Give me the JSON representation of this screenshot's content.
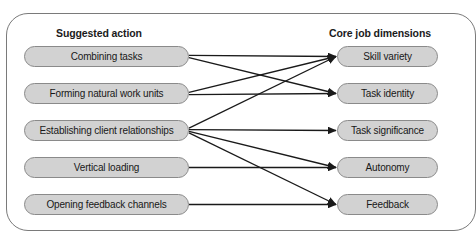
{
  "figure": {
    "frame": {
      "border_color": "#7a7a7a"
    },
    "colors": {
      "node_fill": "#d2d2d2",
      "node_border": "#8a8a8a",
      "connector": "#1a1a1a",
      "text": "#181818"
    }
  },
  "headers": {
    "left": "Suggested action",
    "right": "Core job dimensions"
  },
  "suggested_actions": [
    {
      "id": "combining-tasks",
      "label": "Combining tasks"
    },
    {
      "id": "forming-work-units",
      "label": "Forming natural work units"
    },
    {
      "id": "client-relationships",
      "label": "Establishing client relationships"
    },
    {
      "id": "vertical-loading",
      "label": "Vertical loading"
    },
    {
      "id": "feedback-channels",
      "label": "Opening feedback channels"
    }
  ],
  "core_job_dimensions": [
    {
      "id": "skill-variety",
      "label": "Skill variety"
    },
    {
      "id": "task-identity",
      "label": "Task identity"
    },
    {
      "id": "task-significance",
      "label": "Task significance"
    },
    {
      "id": "autonomy",
      "label": "Autonomy"
    },
    {
      "id": "feedback",
      "label": "Feedback"
    }
  ],
  "connections": [
    {
      "from": "combining-tasks",
      "to": "skill-variety"
    },
    {
      "from": "combining-tasks",
      "to": "task-identity"
    },
    {
      "from": "forming-work-units",
      "to": "skill-variety"
    },
    {
      "from": "forming-work-units",
      "to": "task-identity"
    },
    {
      "from": "client-relationships",
      "to": "skill-variety"
    },
    {
      "from": "client-relationships",
      "to": "task-significance"
    },
    {
      "from": "client-relationships",
      "to": "autonomy"
    },
    {
      "from": "client-relationships",
      "to": "feedback"
    },
    {
      "from": "vertical-loading",
      "to": "autonomy"
    },
    {
      "from": "feedback-channels",
      "to": "feedback"
    }
  ]
}
